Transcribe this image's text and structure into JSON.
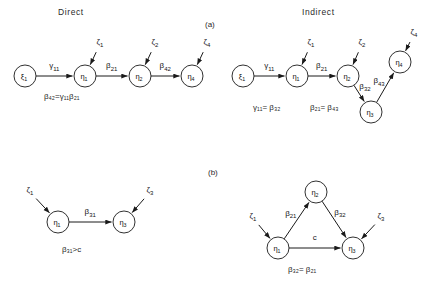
{
  "figure": {
    "headers": {
      "direct": "Direct",
      "indirect": "Indirect"
    },
    "panel_labels": {
      "a": "(a)",
      "b": "(b)"
    }
  },
  "panels": {
    "a_direct": {
      "nodes": [
        {
          "id": "xi1",
          "symbol": "ξ",
          "sub": "1",
          "cx": 25,
          "cy": 76
        },
        {
          "id": "eta1",
          "symbol": "η",
          "sub": "1",
          "cx": 85,
          "cy": 76
        },
        {
          "id": "eta2",
          "symbol": "η",
          "sub": "2",
          "cx": 140,
          "cy": 76
        },
        {
          "id": "eta4",
          "symbol": "η",
          "sub": "4",
          "cx": 192,
          "cy": 76
        }
      ],
      "disturbances": [
        {
          "id": "zeta1",
          "symbol": "ζ",
          "sub": "1",
          "x": 100,
          "y": 44
        },
        {
          "id": "zeta2",
          "symbol": "ζ",
          "sub": "2",
          "x": 155,
          "y": 44
        },
        {
          "id": "zeta4",
          "symbol": "ζ",
          "sub": "4",
          "x": 207,
          "y": 44
        }
      ],
      "edges": [
        {
          "from": "xi1",
          "to": "eta1",
          "label": "γ",
          "sub": "11"
        },
        {
          "from": "eta1",
          "to": "eta2",
          "label": "β",
          "sub": "21"
        },
        {
          "from": "eta2",
          "to": "eta4",
          "label": "β",
          "sub": "42"
        }
      ],
      "equation": "β",
      "equation_full": "β₄₂ = γ₁₁β₂₁"
    },
    "a_indirect": {
      "nodes": [
        {
          "id": "xi1",
          "symbol": "ξ",
          "sub": "1",
          "cx": 243,
          "cy": 76
        },
        {
          "id": "eta1",
          "symbol": "η",
          "sub": "1",
          "cx": 297,
          "cy": 76
        },
        {
          "id": "eta2",
          "symbol": "η",
          "sub": "2",
          "cx": 348,
          "cy": 76
        },
        {
          "id": "eta3",
          "symbol": "η",
          "sub": "3",
          "cx": 371,
          "cy": 112
        },
        {
          "id": "eta4",
          "symbol": "η",
          "sub": "4",
          "cx": 400,
          "cy": 62
        }
      ],
      "disturbances": [
        {
          "id": "zeta1",
          "symbol": "ζ",
          "sub": "1",
          "x": 311,
          "y": 44
        },
        {
          "id": "zeta2",
          "symbol": "ζ",
          "sub": "2",
          "x": 362,
          "y": 44
        },
        {
          "id": "zeta4",
          "symbol": "ζ",
          "sub": "4",
          "x": 414,
          "y": 34
        }
      ],
      "edges": [
        {
          "from": "xi1",
          "to": "eta1",
          "label": "γ",
          "sub": "11"
        },
        {
          "from": "eta1",
          "to": "eta2",
          "label": "β",
          "sub": "21"
        },
        {
          "from": "eta2",
          "to": "eta3",
          "label": "β",
          "sub": "32"
        },
        {
          "from": "eta3",
          "to": "eta4",
          "label": "β",
          "sub": "43"
        }
      ],
      "equation_1": "γ₁₁ = β₃₂",
      "equation_2": "β₂₁ = β₄₃"
    },
    "b_direct": {
      "nodes": [
        {
          "id": "eta1",
          "symbol": "η",
          "sub": "1",
          "cx": 58,
          "cy": 222
        },
        {
          "id": "eta3",
          "symbol": "η",
          "sub": "3",
          "cx": 124,
          "cy": 222
        }
      ],
      "disturbances": [
        {
          "id": "zeta1",
          "symbol": "ζ",
          "sub": "1",
          "x": 30,
          "y": 192
        },
        {
          "id": "zeta3",
          "symbol": "ζ",
          "sub": "3",
          "x": 150,
          "y": 192
        }
      ],
      "edges": [
        {
          "from": "eta1",
          "to": "eta3",
          "label": "β",
          "sub": "31"
        }
      ],
      "equation": "β₃₁>c"
    },
    "b_indirect": {
      "nodes": [
        {
          "id": "eta2",
          "symbol": "η",
          "sub": "2",
          "cx": 316,
          "cy": 192
        },
        {
          "id": "eta1",
          "symbol": "η",
          "sub": "1",
          "cx": 278,
          "cy": 248
        },
        {
          "id": "eta3",
          "symbol": "η",
          "sub": "3",
          "cx": 353,
          "cy": 248
        }
      ],
      "disturbances": [
        {
          "id": "zeta1",
          "symbol": "ζ",
          "sub": "1",
          "x": 253,
          "y": 218
        },
        {
          "id": "zeta3",
          "symbol": "ζ",
          "sub": "3",
          "x": 381,
          "y": 218
        }
      ],
      "edges": [
        {
          "from": "eta1",
          "to": "eta2",
          "label": "β",
          "sub": "21"
        },
        {
          "from": "eta2",
          "to": "eta3",
          "label": "β",
          "sub": "32"
        },
        {
          "from": "eta1",
          "to": "eta3",
          "label": "c",
          "sub": ""
        }
      ],
      "equation": "β₃₂= β₂₁"
    }
  },
  "labels": {
    "eq_a_left": "β₄₂=γ₁₁β₂₁",
    "eq_a_r1": "γ₁₁= β₃₂",
    "eq_a_r2": "β₂₁= β₄₃",
    "eq_b_left": "β₃₁>c",
    "eq_b_right": "β₃₂= β₂₁"
  },
  "style": {
    "ink": "#1a1a1a",
    "background": "#ffffff"
  }
}
